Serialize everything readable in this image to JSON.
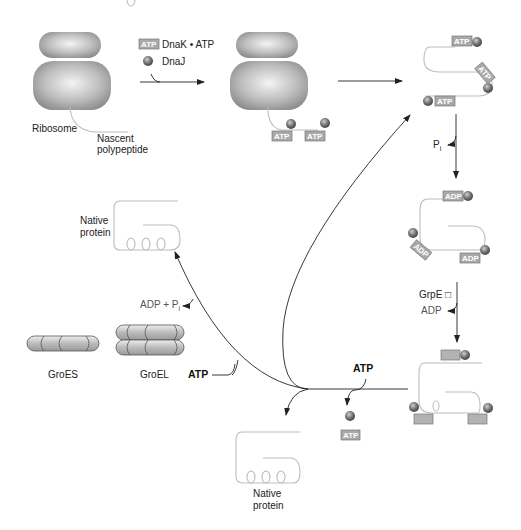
{
  "legend": {
    "dnak_label": "DnaK • ATP",
    "dnaj_label": "DnaJ",
    "tag": "ATP"
  },
  "labels": {
    "ribosome": "Ribosome",
    "nascent_1": "Nascent",
    "nascent_2": "polypeptide",
    "pi_main": "P",
    "pi_sub": "i",
    "grpe": "GrpE □",
    "adp_release": "ADP",
    "native_top_1": "Native",
    "native_top_2": "protein",
    "native_bottom_1": "Native",
    "native_bottom_2": "protein",
    "adp_pi": "ADP + P",
    "adp_pi_sub": "i",
    "groes": "GroES",
    "groel": "GroEL",
    "atp_groel": "ATP",
    "atp_right": "ATP"
  },
  "tags": {
    "atp": "ATP",
    "adp": "ADP"
  },
  "colors": {
    "sphere": "#6e6e6e",
    "tag_fill": "#a9a9a9",
    "strand": "#bdbdbd",
    "arrow": "#222222"
  }
}
